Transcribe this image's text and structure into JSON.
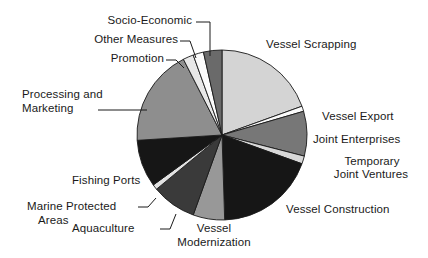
{
  "chart_data": {
    "type": "pie",
    "title": "",
    "subtitle": "",
    "xlabel": "",
    "ylabel": "",
    "legend_position": "none",
    "grid": false,
    "labels_style": "outside-with-leader-lines",
    "start_angle_deg": 0,
    "direction": "clockwise",
    "center": {
      "x": 222,
      "y": 135
    },
    "radius": 85,
    "categories": [
      "Vessel Scrapping",
      "Vessel Export",
      "Joint Enterprises",
      "Temporary Joint Ventures",
      "Vessel Construction",
      "Vessel Modernization",
      "Aquaculture",
      "Marine Protected Areas",
      "Fishing Ports",
      "Processing and Marketing",
      "Promotion",
      "Other Measures",
      "Socio-Economic"
    ],
    "values": [
      19.5,
      1.0,
      8.5,
      1.5,
      19.0,
      6.0,
      8.5,
      1.0,
      9.0,
      18.5,
      2.0,
      2.0,
      3.5
    ],
    "units": "percent",
    "colors": [
      "#d4d4d4",
      "#fbfbfb",
      "#777777",
      "#d8d8d8",
      "#161616",
      "#989898",
      "#3a3a3a",
      "#e2e2e2",
      "#161616",
      "#8e8e8e",
      "#e8e8e8",
      "#fbfbfb",
      "#6a6a6a"
    ],
    "slice_outline_color": "#1a1a1a",
    "background_color": "#ffffff"
  },
  "labels": {
    "socio_economic": "Socio-Economic",
    "other_measures": "Other Measures",
    "promotion": "Promotion",
    "vessel_scrapping": "Vessel Scrapping",
    "processing_and_marketing_line1": "Processing and",
    "processing_and_marketing_line2": "Marketing",
    "vessel_export": "Vessel Export",
    "joint_enterprises": "Joint Enterprises",
    "temporary_line1": "Temporary",
    "temporary_line2": "Joint Ventures",
    "vessel_construction": "Vessel Construction",
    "fishing_ports": "Fishing Ports",
    "marine_protected_line1": "Marine Protected",
    "marine_protected_line2": "Areas",
    "aquaculture": "Aquaculture",
    "vessel_modernization_line1": "Vessel",
    "vessel_modernization_line2": "Modernization"
  }
}
